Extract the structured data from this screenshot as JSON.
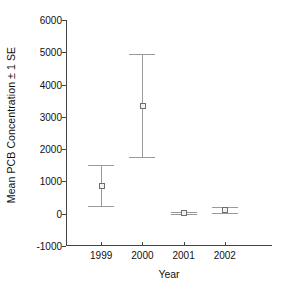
{
  "chart_data": {
    "type": "scatter",
    "title": "",
    "xlabel": "Year",
    "ylabel": "Mean PCB Concentration ± 1 SE",
    "categories": [
      "1999",
      "2000",
      "2001",
      "2002"
    ],
    "values": [
      870,
      3340,
      20,
      110
    ],
    "error_upper": [
      1520,
      4950,
      60,
      200
    ],
    "error_lower": [
      230,
      1760,
      -20,
      20
    ],
    "yticks": [
      -1000,
      0,
      1000,
      2000,
      3000,
      4000,
      5000,
      6000
    ],
    "ytick_labels": [
      "-1000",
      "0",
      "1000",
      "2000",
      "3000",
      "4000",
      "5000",
      "6000"
    ],
    "ylim": [
      -1000,
      6000
    ],
    "grid": false,
    "legend": "none",
    "marker_style": "open-square",
    "series_name": "Mean PCB Concentration",
    "colors": {
      "axis": "#444444",
      "error_bar": "#9a9a9a",
      "marker_edge": "#6e6e6e",
      "marker_fill": "#f2f2f2",
      "text": "#111111",
      "background": "#ffffff"
    }
  }
}
